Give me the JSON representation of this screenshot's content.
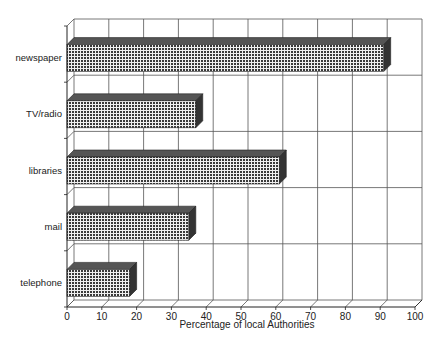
{
  "chart_data": {
    "type": "bar",
    "orientation": "horizontal",
    "style": "3d",
    "title": "",
    "xlabel": "Percentage of local Authorities",
    "ylabel": "",
    "categories": [
      "newspaper",
      "TV/radio",
      "libraries",
      "mail",
      "telephone"
    ],
    "values": [
      91,
      37,
      61,
      35,
      18
    ],
    "xlim": [
      0,
      100
    ],
    "xticks": [
      0,
      10,
      20,
      30,
      40,
      50,
      60,
      70,
      80,
      90,
      100
    ],
    "grid": true,
    "legend": null,
    "bar_fill": "crosshatch-dark",
    "colors": {
      "bar": "#4a4a4a",
      "bar_side": "#333333",
      "grid": "#555555"
    }
  }
}
